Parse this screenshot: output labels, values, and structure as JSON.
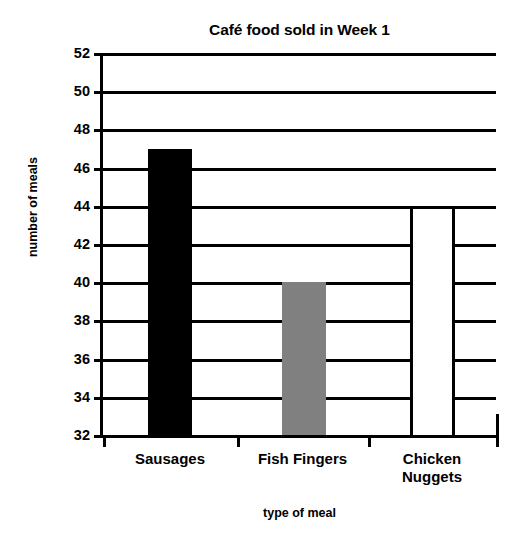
{
  "chart_data": {
    "type": "bar",
    "title": "Café food sold in Week 1",
    "xlabel": "type of meal",
    "ylabel": "number of meals",
    "categories": [
      "Sausages",
      "Fish Fingers",
      "Chicken\nNuggets"
    ],
    "values": [
      47,
      40,
      44
    ],
    "ylim": [
      32,
      52
    ],
    "ytick_step": 2,
    "yticks": [
      52,
      50,
      48,
      46,
      44,
      42,
      40,
      38,
      36,
      34,
      32
    ],
    "ytick_labels": [
      "52",
      "50",
      "48",
      "46",
      "44",
      "42",
      "40",
      "38",
      "36",
      "34",
      "32"
    ],
    "grid": true,
    "grid_axis": "y",
    "legend": false,
    "bar_colors": [
      "#000000",
      "#808080",
      "#FFFFFF"
    ],
    "bar_edge_color": "#000000",
    "series": [
      {
        "name": "number of meals",
        "values": [
          47,
          40,
          44
        ]
      }
    ],
    "points": [
      {
        "category": "Sausages",
        "value": 47,
        "fill": "#000000"
      },
      {
        "category": "Fish Fingers",
        "value": 40,
        "fill": "#808080"
      },
      {
        "category": "Chicken Nuggets",
        "value": 44,
        "fill": "#FFFFFF"
      }
    ]
  }
}
